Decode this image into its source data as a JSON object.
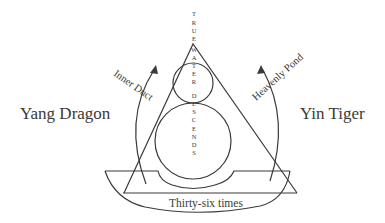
{
  "labels": {
    "left": "Yang Dragon",
    "right": "Yin Tiger",
    "left_arrow": "Inner Duct",
    "right_arrow": "Heavenly Pond",
    "bowl": "Thirty-six times",
    "vertical": [
      "T",
      "R",
      "U",
      "E",
      "W",
      "A",
      "T",
      "E",
      "R",
      "D",
      "E",
      "S",
      "C",
      "E",
      "N",
      "D",
      "S"
    ]
  },
  "colors": {
    "stroke": "#3a3a3a",
    "background": "#ffffff"
  }
}
